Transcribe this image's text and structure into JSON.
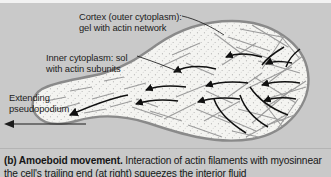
{
  "figure": {
    "panel_id": "(b)",
    "background_color": "#c9c9c9",
    "cell_fill_color": "#f4f4f1",
    "cell_border_color": "#8a8a8a",
    "filament_color": "#9a9a9a",
    "arrow_color": "#101010",
    "text_color": "#1c1c1c"
  },
  "labels": {
    "cortex": {
      "line1": "Cortex (outer cytoplasm):",
      "line2": "gel with actin network"
    },
    "inner_cytoplasm": {
      "line1": "Inner cytoplasm: sol",
      "line2": "with actin subunits"
    },
    "pseudopodium": {
      "line1": "Extending",
      "line2": "pseudopodium"
    }
  },
  "caption": {
    "lead": "(b) Amoeboid movement.",
    "body": " Interaction of actin filaments with myosin",
    "line2_clipped": "near the cell's trailing end (at right) squeezes the interior fluid"
  },
  "icons": {
    "direction_arrow": "left-arrow-icon",
    "flow_arrows": "cytoplasmic-streaming-arrows"
  }
}
